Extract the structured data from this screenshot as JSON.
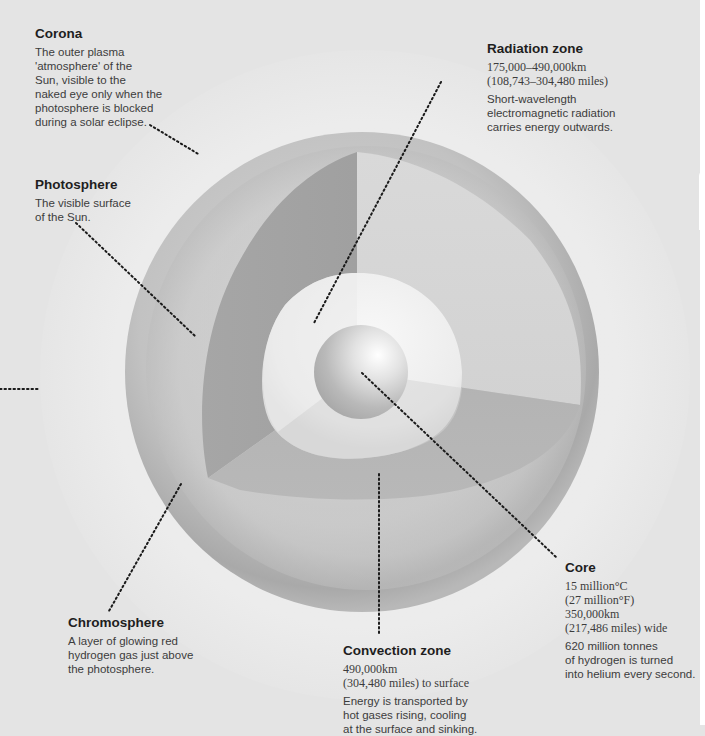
{
  "diagram": {
    "layers": [
      "Core",
      "Radiation zone",
      "Convection zone",
      "Photosphere",
      "Chromosphere",
      "Corona"
    ]
  },
  "labels": {
    "corona": {
      "title": "Corona",
      "lines": [
        "The outer plasma",
        "'atmosphere' of the",
        "Sun, visible to the",
        "naked eye only when the",
        "photosphere is blocked",
        "during a solar eclipse."
      ]
    },
    "photosphere": {
      "title": "Photosphere",
      "lines": [
        "The visible surface",
        "of the Sun."
      ]
    },
    "radiation_zone": {
      "title": "Radiation zone",
      "stats": [
        "175,000–490,000km",
        "(108,743–304,480 miles)"
      ],
      "lines": [
        "Short-wavelength",
        "electromagnetic radiation",
        "carries energy outwards."
      ]
    },
    "chromosphere": {
      "title": "Chromosphere",
      "lines": [
        "A layer of glowing red",
        "hydrogen gas just above",
        "the photosphere."
      ]
    },
    "convection_zone": {
      "title": "Convection zone",
      "stats": [
        "490,000km",
        "(304,480 miles) to surface"
      ],
      "lines": [
        "Energy is transported by",
        "hot gases rising, cooling",
        "at the surface and sinking."
      ]
    },
    "core": {
      "title": "Core",
      "stats": [
        "15 million°C",
        "(27 million°F)",
        "350,000km",
        "(217,486 miles) wide"
      ],
      "lines": [
        "620 million tonnes",
        "of hydrogen is turned",
        "into helium every second."
      ]
    }
  },
  "colors": {
    "background": "#e4e4e4",
    "outer_shell": "#b5b5b5",
    "cutaway_dark": "#a8a8a8",
    "radiation_zone": "#e9e9e9",
    "core": "#c4c4c4",
    "leader_line": "#1a1a1a"
  }
}
